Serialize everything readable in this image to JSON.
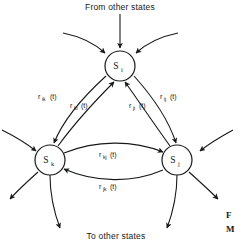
{
  "figure": {
    "domain": "diagram",
    "diagram_type": "state-transition-diagram",
    "background_color": "#ffffff",
    "ink_color": "#17191a",
    "width": 244,
    "height": 243
  },
  "captions": {
    "top": "From other states",
    "bottom": "To other states"
  },
  "figure_label": {
    "line1": "F",
    "line2": "M"
  },
  "nodes": [
    {
      "id": "i",
      "base": "S",
      "subscript": "i",
      "label": "S_i",
      "cx": 120,
      "cy": 66,
      "r": 15
    },
    {
      "id": "k",
      "base": "S",
      "subscript": "k",
      "label": "S_k",
      "cx": 50,
      "cy": 160,
      "r": 15
    },
    {
      "id": "j",
      "base": "S",
      "subscript": "j",
      "label": "S_j",
      "cx": 177,
      "cy": 160,
      "r": 15
    }
  ],
  "transitions": [
    {
      "id": "ik",
      "base": "r",
      "subscript": "ik",
      "suffix": " (t)",
      "label": "r_ik (t)",
      "from": "i",
      "to": "k",
      "label_x": 38,
      "label_y": 99
    },
    {
      "id": "ki",
      "base": "r",
      "subscript": "ki",
      "suffix": " (t)",
      "label": "r_ki (t)",
      "from": "k",
      "to": "i",
      "label_x": 70,
      "label_y": 108
    },
    {
      "id": "ji",
      "base": "r",
      "subscript": "ji",
      "suffix": " (t)",
      "label": "r_ji (t)",
      "from": "j",
      "to": "i",
      "label_x": 129,
      "label_y": 108
    },
    {
      "id": "ij",
      "base": "r",
      "subscript": "ij",
      "suffix": " (t)",
      "label": "r_ij (t)",
      "from": "i",
      "to": "j",
      "label_x": 160,
      "label_y": 99
    },
    {
      "id": "kj",
      "base": "r",
      "subscript": "kj",
      "suffix": " (t)",
      "label": "r_kj (t)",
      "from": "k",
      "to": "j",
      "label_x": 99,
      "label_y": 157
    },
    {
      "id": "jk",
      "base": "r",
      "subscript": "jk",
      "suffix": " (t)",
      "label": "r_jk (t)",
      "from": "j",
      "to": "k",
      "label_x": 99,
      "label_y": 189
    }
  ],
  "external_arrows": {
    "into_i": 3,
    "out_of_k": 2,
    "into_k": 1,
    "out_of_j": 2,
    "into_j": 1
  }
}
